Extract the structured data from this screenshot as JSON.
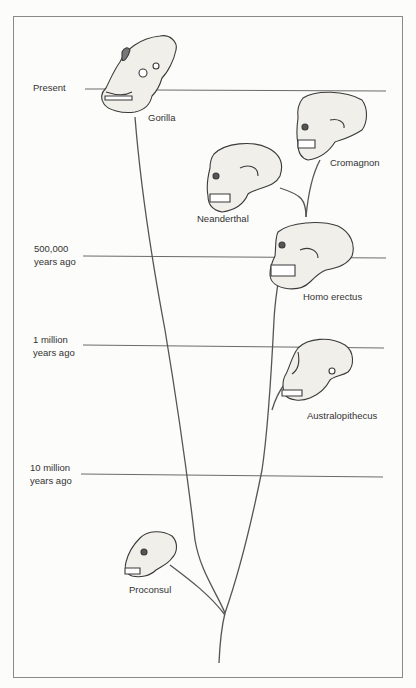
{
  "timeline": [
    {
      "label_line1": "Present",
      "label_line2": ""
    },
    {
      "label_line1": "500,000",
      "label_line2": "years ago"
    },
    {
      "label_line1": "1 million",
      "label_line2": "years ago"
    },
    {
      "label_line1": "10 million",
      "label_line2": "years ago"
    }
  ],
  "species": [
    {
      "name": "Gorilla",
      "icon": "gorilla-skull-icon"
    },
    {
      "name": "Cromagnon",
      "icon": "cromagnon-skull-icon"
    },
    {
      "name": "Neanderthal",
      "icon": "neanderthal-skull-icon"
    },
    {
      "name": "Homo erectus",
      "icon": "homo-erectus-skull-icon"
    },
    {
      "name": "Australopithecus",
      "icon": "australopithecus-skull-icon"
    },
    {
      "name": "Proconsul",
      "icon": "proconsul-skull-icon"
    }
  ],
  "colors": {
    "line": "#555555",
    "frame": "#8a8a8a",
    "skull_fill": "#f1efea",
    "skull_stroke": "#3a3a3a"
  }
}
